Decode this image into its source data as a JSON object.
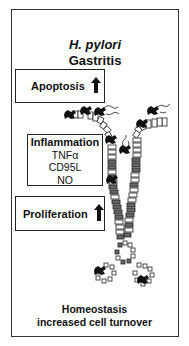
{
  "title": {
    "organism": "H. pylori",
    "condition": "Gastritis"
  },
  "boxes": {
    "apoptosis": {
      "label": "Apoptosis",
      "direction": "up"
    },
    "inflammation": {
      "label": "Inflammation",
      "mediators": [
        "TNFα",
        "CD95L",
        "NO"
      ]
    },
    "proliferation": {
      "label": "Proliferation",
      "direction": "up"
    }
  },
  "footer": {
    "line1": "Homeostasis",
    "line2": "increased cell turnover"
  },
  "icons": {
    "up_arrow": "arrow-up-icon",
    "gland": "gastric-gland-illustration",
    "bacteria": "h-pylori-bacteria-icon"
  },
  "colors": {
    "line": "#222222",
    "background": "#ffffff",
    "cell_dark": "#555555",
    "cell_light": "#ffffff"
  }
}
